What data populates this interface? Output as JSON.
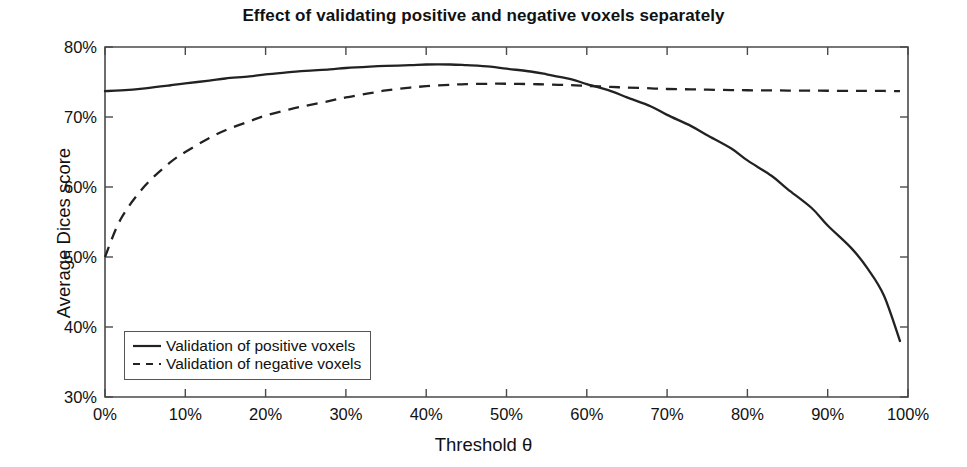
{
  "chart_data": {
    "type": "line",
    "title": "Effect of validating positive and negative voxels separately",
    "xlabel": "Threshold θ",
    "ylabel": "Average Dices score",
    "xlim": [
      0,
      100
    ],
    "ylim": [
      30,
      80
    ],
    "grid": false,
    "legend_position": "lower left",
    "x_tick_labels": [
      "0%",
      "10%",
      "20%",
      "30%",
      "40%",
      "50%",
      "60%",
      "70%",
      "80%",
      "90%",
      "100%"
    ],
    "x_ticks": [
      0,
      10,
      20,
      30,
      40,
      50,
      60,
      70,
      80,
      90,
      100
    ],
    "y_tick_labels": [
      "30%",
      "40%",
      "50%",
      "60%",
      "70%",
      "80%"
    ],
    "y_ticks": [
      30,
      40,
      50,
      60,
      70,
      80
    ],
    "x": [
      0,
      2,
      5,
      8,
      10,
      13,
      15,
      18,
      20,
      23,
      25,
      28,
      30,
      33,
      35,
      38,
      40,
      43,
      45,
      48,
      50,
      53,
      55,
      58,
      60,
      63,
      65,
      68,
      70,
      73,
      75,
      78,
      80,
      83,
      85,
      88,
      90,
      93,
      95,
      97,
      99
    ],
    "series": [
      {
        "name": "Validation of positive voxels",
        "style": "solid",
        "color": "#222222",
        "values": [
          73.7,
          73.8,
          74.1,
          74.5,
          74.8,
          75.2,
          75.5,
          75.8,
          76.1,
          76.4,
          76.6,
          76.8,
          77.0,
          77.2,
          77.3,
          77.4,
          77.5,
          77.5,
          77.4,
          77.2,
          76.9,
          76.5,
          76.1,
          75.4,
          74.7,
          73.7,
          72.8,
          71.5,
          70.3,
          68.7,
          67.4,
          65.5,
          63.8,
          61.6,
          59.7,
          57.0,
          54.5,
          51.2,
          48.3,
          44.5,
          38.0
        ]
      },
      {
        "name": "Validation of negative voxels",
        "style": "dashed",
        "color": "#222222",
        "values": [
          50.0,
          55.5,
          60.2,
          63.4,
          65.0,
          67.0,
          68.1,
          69.4,
          70.2,
          71.1,
          71.6,
          72.3,
          72.8,
          73.4,
          73.8,
          74.2,
          74.4,
          74.6,
          74.7,
          74.75,
          74.75,
          74.7,
          74.65,
          74.55,
          74.45,
          74.3,
          74.2,
          74.1,
          74.0,
          73.95,
          73.9,
          73.85,
          73.82,
          73.8,
          73.78,
          73.76,
          73.75,
          73.74,
          73.73,
          73.72,
          73.7
        ]
      }
    ]
  },
  "legend": {
    "items": [
      {
        "label": "Validation of positive voxels",
        "style": "solid"
      },
      {
        "label": "Validation of negative voxels",
        "style": "dashed"
      }
    ]
  }
}
